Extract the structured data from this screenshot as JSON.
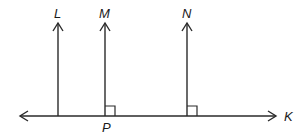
{
  "diagram": {
    "type": "geometry",
    "colors": {
      "stroke": "#2a2a2a",
      "background": "#ffffff"
    },
    "horizontal_line": {
      "label": "K",
      "y": 116,
      "x_start": 20,
      "x_end": 276,
      "arrows": "both"
    },
    "rays": [
      {
        "label": "L",
        "x": 58,
        "y_top": 23,
        "right_angle": false
      },
      {
        "label": "M",
        "x": 105,
        "y_top": 23,
        "right_angle": true
      },
      {
        "label": "N",
        "x": 187,
        "y_top": 23,
        "right_angle": true
      }
    ],
    "points": [
      {
        "label": "P",
        "x": 106,
        "y": 130
      }
    ],
    "labels": {
      "L": "L",
      "M": "M",
      "N": "N",
      "K": "K",
      "P": "P"
    }
  }
}
